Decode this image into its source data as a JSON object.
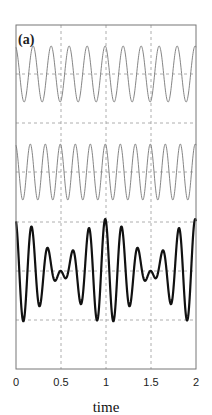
{
  "chart_data": {
    "type": "line",
    "title": "",
    "panel_label": "(a)",
    "xlabel": "time",
    "ylabel": "",
    "xlim": [
      0,
      2
    ],
    "x_ticks": [
      "0",
      "0.5",
      "1",
      "1.5",
      "2"
    ],
    "grid": true,
    "grid_style": "dashed",
    "series": [
      {
        "name": "signal 1",
        "frequency_hz": 5,
        "amplitude": 1,
        "offset_row": 0,
        "style": "thin gray"
      },
      {
        "name": "signal 2",
        "frequency_hz": 6,
        "amplitude": 1,
        "offset_row": 1,
        "style": "thin gray"
      },
      {
        "name": "sum (signal 1 + signal 2)",
        "frequency_hz": [
          5,
          6
        ],
        "amplitude": 2,
        "offset_row": 2,
        "style": "thick black",
        "note": "beating; envelope minimum near t=0.6"
      }
    ]
  },
  "colors": {
    "frame": "#777777",
    "grid": "#999999",
    "thin_line": "#777777",
    "thick_line": "#111111"
  }
}
